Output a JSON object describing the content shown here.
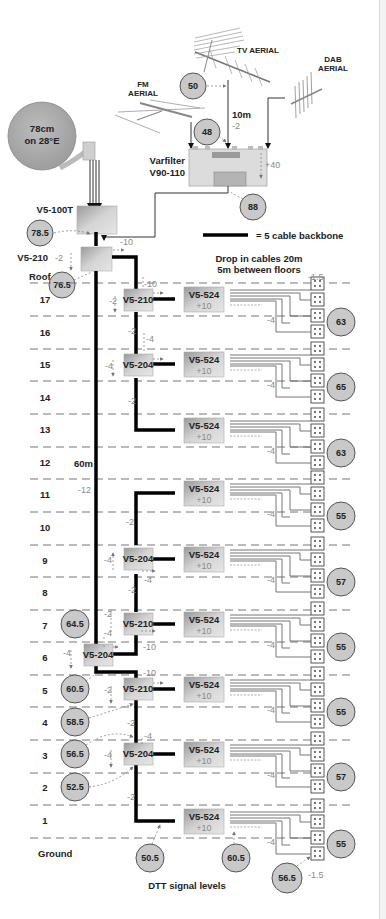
{
  "title": "DTT signal levels",
  "legend": {
    "backbone_label": "= 5 cable backbone"
  },
  "notes": {
    "drop_cables_line1": "Drop in cables 20m",
    "drop_cables_line2": "5m between floors"
  },
  "headend": {
    "dish": {
      "line1": "78cm",
      "line2": "on 28°E"
    },
    "tv_aerial": "TV AERIAL",
    "fm_aerial": {
      "line1": "FM",
      "line2": "AERIAL"
    },
    "dab_aerial": {
      "line1": "DAB",
      "line2": "AERIAL"
    },
    "aerial_cable_length": "10m",
    "aerial_cable_loss": "-2",
    "varfilter": {
      "line1": "Varfilter",
      "line2": "V90-110",
      "gain": "+40"
    },
    "levels": {
      "aerial": "50",
      "varfilter_in": "48",
      "varfilter_out": "88"
    },
    "v5_100t": "V5-100T",
    "v5_100t_level": "78.5",
    "v5_210_top": "V5-210",
    "v5_210_top_loss": "-2",
    "v5_210_top_tap": "-10",
    "v5_210_top_level": "76.5"
  },
  "backbone": {
    "length": "60m",
    "loss": "-12"
  },
  "floors": [
    {
      "label": "Roof"
    },
    {
      "label": "17"
    },
    {
      "label": "16"
    },
    {
      "label": "15"
    },
    {
      "label": "14"
    },
    {
      "label": "13"
    },
    {
      "label": "12"
    },
    {
      "label": "11"
    },
    {
      "label": "10"
    },
    {
      "label": "9"
    },
    {
      "label": "8"
    },
    {
      "label": "7"
    },
    {
      "label": "6"
    },
    {
      "label": "5"
    },
    {
      "label": "4"
    },
    {
      "label": "3"
    },
    {
      "label": "2"
    },
    {
      "label": "1"
    },
    {
      "label": "Ground"
    }
  ],
  "devices": {
    "splitter_17": "V5-210",
    "splitter_15": "V5-204",
    "splitter_9": "V5-204",
    "splitter_7": "V5-210",
    "splitter_6": "V5-204",
    "splitter_5": "V5-210",
    "splitter_3": "V5-204",
    "amp": "V5-524",
    "amp_gain": "+10"
  },
  "losses": {
    "tap_17": "-10",
    "sp17_loss": "-2",
    "riser_16": "-2",
    "sp15_tap": "-4",
    "sp15_loss": "-4",
    "riser_14": "-2",
    "riser_10": "-2",
    "sp9_loss": "-4",
    "sp9_tap": "-4",
    "riser_8": "-2",
    "sp7_a": "-2",
    "sp7_b": "-4",
    "sp6_loss": "-4",
    "sp6_tap": "-10",
    "sp5_tap": "-10",
    "sp5_loss": "-2",
    "riser_4": "-2",
    "sp3_tap": "-4",
    "sp3_loss": "-4",
    "riser_2": "-2",
    "drop": "-4",
    "outlet": "-1.5"
  },
  "left_levels": {
    "f7": "64.5",
    "f5": "60.5",
    "f4": "58.5",
    "f3": "56.5",
    "f2": "52.5"
  },
  "right_levels": [
    "63",
    "65",
    "63",
    "55",
    "57",
    "55",
    "55",
    "57",
    "55"
  ],
  "bottom_levels": {
    "amp_in": "50.5",
    "amp_out": "60.5",
    "outlet_in": "56.5"
  }
}
